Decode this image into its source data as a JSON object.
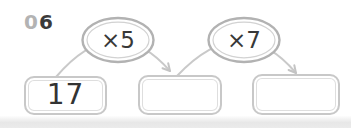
{
  "worksheet": {
    "problem_number": {
      "prefix": "0",
      "digit": "6"
    },
    "start_box": {
      "value": "17"
    },
    "middle_box": {
      "value": ""
    },
    "end_box": {
      "value": ""
    },
    "operations": [
      {
        "label": "×5"
      },
      {
        "label": "×7"
      }
    ],
    "icons": [
      "arrow-right-curved-icon",
      "arrow-right-curved-icon"
    ],
    "colors": {
      "line_gray": "#c9c9c9",
      "ring_gray": "#b2b2b2",
      "inner_ring_gray": "#d2d2d2",
      "text_dark": "#3a3a3a",
      "muted_gray": "#b3b3b3",
      "background": "#ffffff"
    }
  }
}
